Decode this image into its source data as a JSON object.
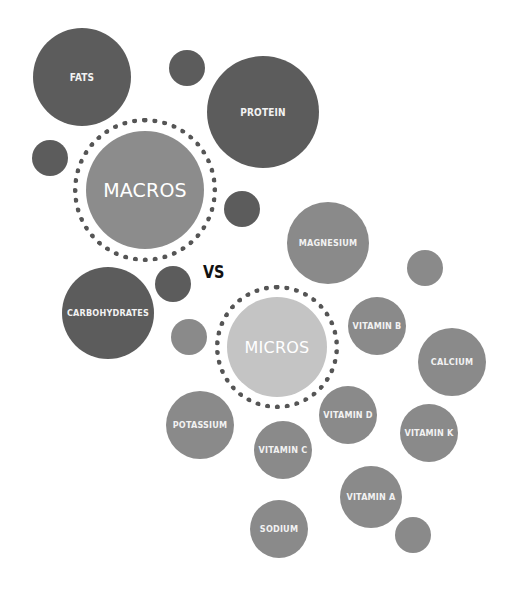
{
  "macros": {
    "label": "MACROS",
    "items": [
      {
        "label": "FATS"
      },
      {
        "label": "PROTEIN"
      },
      {
        "label": "CARBOHYDRATES"
      }
    ]
  },
  "versus": "VS",
  "micros": {
    "label": "MICROS",
    "items": [
      {
        "label": "MAGNESIUM"
      },
      {
        "label": "VITAMIN B"
      },
      {
        "label": "CALCIUM"
      },
      {
        "label": "POTASSIUM"
      },
      {
        "label": "VITAMIN D"
      },
      {
        "label": "VITAMIN C"
      },
      {
        "label": "VITAMIN K"
      },
      {
        "label": "VITAMIN A"
      },
      {
        "label": "SODIUM"
      }
    ]
  },
  "colors": {
    "macro": "#5c5c5c",
    "macro_hub": "#8c8c8c",
    "micro": "#8a8a8a",
    "micro_hub": "#c4c4c4",
    "ring": "#555555"
  }
}
